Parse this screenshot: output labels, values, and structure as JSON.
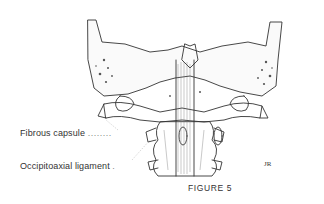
{
  "figure": {
    "caption": "FIGURE 5",
    "signature": "JR",
    "labels": [
      {
        "text": "Fibrous capsule",
        "leader": "........"
      },
      {
        "text": "Occipitoaxial ligament",
        "leader": "."
      }
    ]
  },
  "colors": {
    "ink": "#333333",
    "background": "#ffffff"
  }
}
